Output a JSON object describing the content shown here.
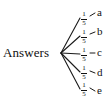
{
  "diagram": {
    "type": "probability-tree",
    "root": {
      "label": "Answers"
    },
    "branches": [
      {
        "probability": "1/5",
        "numerator": "1",
        "denominator": "5",
        "outcome": "a"
      },
      {
        "probability": "1/5",
        "numerator": "1",
        "denominator": "5",
        "outcome": "b"
      },
      {
        "probability": "1/5",
        "numerator": "1",
        "denominator": "5",
        "outcome": "c"
      },
      {
        "probability": "1/5",
        "numerator": "1",
        "denominator": "5",
        "outcome": "d"
      },
      {
        "probability": "1/5",
        "numerator": "1",
        "denominator": "5",
        "outcome": "e"
      }
    ],
    "colors": {
      "line": "#1a1a1a",
      "text": "#111111",
      "background": "#ffffff"
    }
  }
}
